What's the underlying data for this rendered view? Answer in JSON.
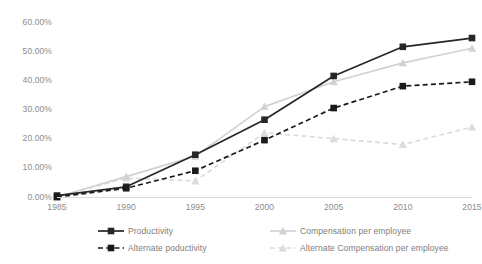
{
  "chart_data": {
    "type": "line",
    "title": "",
    "subtitle": "",
    "xlabel": "",
    "ylabel": "",
    "x": [
      1985,
      1990,
      1995,
      2000,
      2005,
      2010,
      2015
    ],
    "categories": [
      "1985",
      "1990",
      "1995",
      "2000",
      "2005",
      "2010",
      "2015"
    ],
    "xlim": [
      1985,
      2015
    ],
    "ylim": [
      0,
      60
    ],
    "y_tick_values": [
      0,
      10,
      20,
      30,
      40,
      50,
      60
    ],
    "y_tick_labels": [
      "0.00%",
      "10.00%",
      "20.00%",
      "30.00%",
      "40.00%",
      "50.00%",
      "60.00%"
    ],
    "x_tick_labels": [
      "1985",
      "1990",
      "1995",
      "2000",
      "2005",
      "2010",
      "2015"
    ],
    "grid": false,
    "legend_position": "bottom",
    "value_suffix": "%",
    "series": [
      {
        "name": "Productivity",
        "values": [
          0.5,
          3.5,
          14.5,
          26.5,
          41.5,
          51.5,
          54.5
        ],
        "color": "#262626",
        "marker": "square",
        "dash": "solid"
      },
      {
        "name": "Alternate poductivity",
        "values": [
          0.0,
          3.0,
          9.0,
          19.5,
          30.5,
          38.0,
          39.5
        ],
        "color": "#1a1a1a",
        "marker": "square",
        "dash": "dashed"
      },
      {
        "name": "Compensation per employee",
        "values": [
          0.0,
          7.0,
          14.0,
          31.0,
          39.5,
          46.0,
          51.0
        ],
        "color": "#d2d2d2",
        "marker": "triangle",
        "dash": "solid"
      },
      {
        "name": "Alternate Compensation per employee",
        "values": [
          0.0,
          6.5,
          5.5,
          22.0,
          20.0,
          18.0,
          24.0
        ],
        "color": "#dcdcdc",
        "marker": "triangle",
        "dash": "dashed"
      }
    ]
  },
  "axis": {
    "y_labels": [
      "60.00%",
      "50.00%",
      "40.00%",
      "30.00%",
      "20.00%",
      "10.00%",
      "0.00%"
    ],
    "x_labels": [
      "1985",
      "1990",
      "1995",
      "2000",
      "2005",
      "2010",
      "2015"
    ]
  },
  "legend": {
    "items": [
      {
        "label": "Productivity",
        "color": "#262626",
        "marker": "square",
        "dash": "solid"
      },
      {
        "label": "Alternate poductivity",
        "color": "#1a1a1a",
        "marker": "square",
        "dash": "dashed"
      },
      {
        "label": "Compensation per employee",
        "color": "#d2d2d2",
        "marker": "triangle",
        "dash": "solid"
      },
      {
        "label": "Alternate Compensation per employee",
        "color": "#dcdcdc",
        "marker": "triangle",
        "dash": "dashed"
      }
    ]
  },
  "colors": {
    "axis_text": "#8c8c8c",
    "axis_line": "#d9d9d9",
    "legend_text": "#7d7d7d",
    "background": "#ffffff"
  }
}
